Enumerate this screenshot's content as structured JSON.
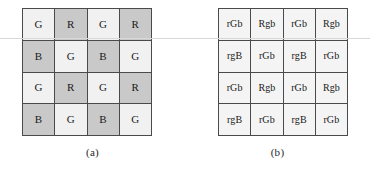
{
  "figure": {
    "panels": [
      {
        "id": "panel-a",
        "caption": "(a)",
        "description": "Bayer color filter array pattern",
        "grid": {
          "rows": 4,
          "cols": 4,
          "cells": [
            [
              {
                "label": "G",
                "tone": "light"
              },
              {
                "label": "R",
                "tone": "gray"
              },
              {
                "label": "G",
                "tone": "light"
              },
              {
                "label": "R",
                "tone": "gray"
              }
            ],
            [
              {
                "label": "B",
                "tone": "gray"
              },
              {
                "label": "G",
                "tone": "light"
              },
              {
                "label": "B",
                "tone": "gray"
              },
              {
                "label": "G",
                "tone": "light"
              }
            ],
            [
              {
                "label": "G",
                "tone": "light"
              },
              {
                "label": "R",
                "tone": "gray"
              },
              {
                "label": "G",
                "tone": "light"
              },
              {
                "label": "R",
                "tone": "gray"
              }
            ],
            [
              {
                "label": "B",
                "tone": "gray"
              },
              {
                "label": "G",
                "tone": "light"
              },
              {
                "label": "B",
                "tone": "gray"
              },
              {
                "label": "G",
                "tone": "light"
              }
            ]
          ]
        }
      },
      {
        "id": "panel-b",
        "caption": "(b)",
        "description": "Per-pixel measured and interpolated channel notation",
        "grid": {
          "rows": 4,
          "cols": 4,
          "cells": [
            [
              {
                "label": "rGb",
                "tone": "light"
              },
              {
                "label": "Rgb",
                "tone": "light"
              },
              {
                "label": "rGb",
                "tone": "light"
              },
              {
                "label": "Rgb",
                "tone": "light"
              }
            ],
            [
              {
                "label": "rgB",
                "tone": "light"
              },
              {
                "label": "rGb",
                "tone": "light"
              },
              {
                "label": "rgB",
                "tone": "light"
              },
              {
                "label": "rGb",
                "tone": "light"
              }
            ],
            [
              {
                "label": "rGb",
                "tone": "light"
              },
              {
                "label": "Rgb",
                "tone": "light"
              },
              {
                "label": "rGb",
                "tone": "light"
              },
              {
                "label": "Rgb",
                "tone": "light"
              }
            ],
            [
              {
                "label": "rgB",
                "tone": "light"
              },
              {
                "label": "rGb",
                "tone": "light"
              },
              {
                "label": "rgB",
                "tone": "light"
              },
              {
                "label": "rGb",
                "tone": "light"
              }
            ]
          ]
        }
      }
    ]
  },
  "colors": {
    "cell_light": "#f1f1f1",
    "cell_gray": "#c9c9c9",
    "cell_plain": "#f4f4f4",
    "grid_border": "#4a4a4a",
    "text": "#1a1a1a",
    "background": "#ffffff",
    "scanline": "#d8d8d8"
  }
}
